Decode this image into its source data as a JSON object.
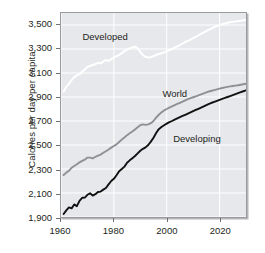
{
  "chart_data": {
    "type": "line",
    "title": "",
    "subtitle": "",
    "xlabel": "",
    "ylabel": "Calories per day per capita",
    "xlim": [
      1960,
      2030
    ],
    "ylim": [
      1900,
      3600
    ],
    "xticks": [
      1960,
      1980,
      2000,
      2020
    ],
    "xticklabels": [
      "1960",
      "1980",
      "2000",
      "2020"
    ],
    "yticks": [
      1900,
      2100,
      2300,
      2500,
      2700,
      2900,
      3100,
      3300,
      3500
    ],
    "yticklabels": [
      "1,900",
      "2,100",
      "2,300",
      "2,500",
      "2,700",
      "2,900",
      "3,100",
      "3,300",
      "3,500"
    ],
    "grid": true,
    "grid_color": "#ffffff",
    "panel_background": "#e7e8ec",
    "legend": "inline-annotations",
    "annotations": [
      {
        "text": "Developed",
        "x": 1968,
        "y": 3400,
        "color": "#231f20"
      },
      {
        "text": "World",
        "x": 1998,
        "y": 2930,
        "color": "#231f20"
      },
      {
        "text": "Developing",
        "x": 2002,
        "y": 2560,
        "color": "#231f20"
      }
    ],
    "series": [
      {
        "name": "Developed",
        "color": "#ffffff",
        "x": [
          1961,
          1962,
          1963,
          1964,
          1965,
          1966,
          1967,
          1968,
          1969,
          1970,
          1971,
          1972,
          1973,
          1974,
          1975,
          1976,
          1977,
          1978,
          1979,
          1980,
          1981,
          1982,
          1983,
          1984,
          1985,
          1986,
          1987,
          1988,
          1989,
          1990,
          1991,
          1992,
          1993,
          1994,
          1995,
          1996,
          1997,
          1998,
          1999,
          2000,
          2001,
          2002,
          2003,
          2004,
          2005,
          2006,
          2007,
          2008,
          2009,
          2010,
          2011,
          2012,
          2013,
          2014,
          2015,
          2016,
          2017,
          2018,
          2019,
          2020,
          2021,
          2022,
          2023,
          2024,
          2025,
          2026,
          2027,
          2028,
          2029,
          2030
        ],
        "y": [
          2945,
          2985,
          3010,
          3040,
          3065,
          3080,
          3090,
          3110,
          3130,
          3150,
          3160,
          3165,
          3175,
          3185,
          3180,
          3195,
          3210,
          3200,
          3215,
          3230,
          3240,
          3250,
          3265,
          3280,
          3295,
          3305,
          3315,
          3320,
          3305,
          3275,
          3250,
          3235,
          3230,
          3232,
          3240,
          3250,
          3258,
          3265,
          3272,
          3280,
          3290,
          3300,
          3312,
          3322,
          3332,
          3345,
          3358,
          3368,
          3378,
          3390,
          3402,
          3414,
          3426,
          3438,
          3450,
          3462,
          3472,
          3482,
          3492,
          3500,
          3506,
          3512,
          3518,
          3522,
          3526,
          3530,
          3533,
          3536,
          3539,
          3542
        ]
      },
      {
        "name": "World",
        "color": "#8e9094",
        "x": [
          1961,
          1962,
          1963,
          1964,
          1965,
          1966,
          1967,
          1968,
          1969,
          1970,
          1971,
          1972,
          1973,
          1974,
          1975,
          1976,
          1977,
          1978,
          1979,
          1980,
          1981,
          1982,
          1983,
          1984,
          1985,
          1986,
          1987,
          1988,
          1989,
          1990,
          1991,
          1992,
          1993,
          1994,
          1995,
          1996,
          1997,
          1998,
          1999,
          2000,
          2001,
          2002,
          2003,
          2004,
          2005,
          2006,
          2007,
          2008,
          2009,
          2010,
          2011,
          2012,
          2013,
          2014,
          2015,
          2016,
          2017,
          2018,
          2019,
          2020,
          2021,
          2022,
          2023,
          2024,
          2025,
          2026,
          2027,
          2028,
          2029,
          2030
        ],
        "y": [
          2250,
          2270,
          2285,
          2310,
          2325,
          2340,
          2355,
          2368,
          2378,
          2395,
          2395,
          2388,
          2402,
          2412,
          2420,
          2435,
          2448,
          2462,
          2478,
          2492,
          2505,
          2525,
          2545,
          2562,
          2582,
          2598,
          2612,
          2630,
          2648,
          2665,
          2672,
          2668,
          2672,
          2682,
          2700,
          2728,
          2752,
          2772,
          2788,
          2800,
          2812,
          2822,
          2832,
          2842,
          2852,
          2862,
          2872,
          2882,
          2890,
          2898,
          2906,
          2914,
          2922,
          2930,
          2938,
          2946,
          2952,
          2958,
          2964,
          2970,
          2975,
          2980,
          2984,
          2988,
          2992,
          2995,
          2998,
          3002,
          3006,
          3010
        ]
      },
      {
        "name": "Developing",
        "color": "#111111",
        "x": [
          1961,
          1962,
          1963,
          1964,
          1965,
          1966,
          1967,
          1968,
          1969,
          1970,
          1971,
          1972,
          1973,
          1974,
          1975,
          1976,
          1977,
          1978,
          1979,
          1980,
          1981,
          1982,
          1983,
          1984,
          1985,
          1986,
          1987,
          1988,
          1989,
          1990,
          1991,
          1992,
          1993,
          1994,
          1995,
          1996,
          1997,
          1998,
          1999,
          2000,
          2001,
          2002,
          2003,
          2004,
          2005,
          2006,
          2007,
          2008,
          2009,
          2010,
          2011,
          2012,
          2013,
          2014,
          2015,
          2016,
          2017,
          2018,
          2019,
          2020,
          2021,
          2022,
          2023,
          2024,
          2025,
          2026,
          2027,
          2028,
          2029,
          2030
        ],
        "y": [
          1925,
          1955,
          1980,
          1972,
          2005,
          1990,
          2035,
          2060,
          2062,
          2085,
          2098,
          2078,
          2090,
          2108,
          2112,
          2128,
          2142,
          2172,
          2200,
          2218,
          2248,
          2282,
          2300,
          2320,
          2352,
          2372,
          2390,
          2408,
          2430,
          2452,
          2468,
          2480,
          2500,
          2528,
          2560,
          2600,
          2632,
          2650,
          2665,
          2678,
          2690,
          2700,
          2712,
          2722,
          2732,
          2742,
          2752,
          2762,
          2772,
          2782,
          2792,
          2802,
          2812,
          2822,
          2832,
          2842,
          2852,
          2860,
          2868,
          2876,
          2884,
          2892,
          2900,
          2908,
          2916,
          2924,
          2932,
          2940,
          2948,
          2956
        ]
      }
    ]
  },
  "axis": {
    "ylabel": "Calories per day per capita"
  }
}
